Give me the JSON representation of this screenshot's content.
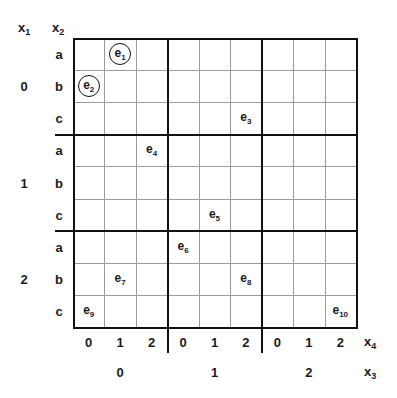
{
  "axes": {
    "row_outer_var": {
      "name": "x",
      "sub": "1"
    },
    "row_inner_var": {
      "name": "x",
      "sub": "2"
    },
    "col_inner_var": {
      "name": "x",
      "sub": "4"
    },
    "col_outer_var": {
      "name": "x",
      "sub": "3"
    }
  },
  "row_outer_labels": [
    "0",
    "1",
    "2"
  ],
  "row_inner_labels": [
    "a",
    "b",
    "c",
    "a",
    "b",
    "c",
    "a",
    "b",
    "c"
  ],
  "col_inner_labels": [
    "0",
    "1",
    "2",
    "0",
    "1",
    "2",
    "0",
    "1",
    "2"
  ],
  "col_outer_labels": [
    "0",
    "1",
    "2"
  ],
  "events": [
    {
      "name": "e",
      "sub": "1",
      "row": 0,
      "col": 1,
      "circled": true
    },
    {
      "name": "e",
      "sub": "2",
      "row": 1,
      "col": 0,
      "circled": true
    },
    {
      "name": "e",
      "sub": "3",
      "row": 2,
      "col": 5,
      "circled": false
    },
    {
      "name": "e",
      "sub": "4",
      "row": 3,
      "col": 2,
      "circled": false
    },
    {
      "name": "e",
      "sub": "5",
      "row": 5,
      "col": 4,
      "circled": false
    },
    {
      "name": "e",
      "sub": "6",
      "row": 6,
      "col": 3,
      "circled": false
    },
    {
      "name": "e",
      "sub": "7",
      "row": 7,
      "col": 1,
      "circled": false
    },
    {
      "name": "e",
      "sub": "8",
      "row": 7,
      "col": 5,
      "circled": false
    },
    {
      "name": "e",
      "sub": "9",
      "row": 8,
      "col": 0,
      "circled": false
    },
    {
      "name": "e",
      "sub": "10",
      "row": 8,
      "col": 8,
      "circled": false
    }
  ]
}
